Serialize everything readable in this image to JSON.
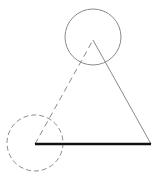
{
  "diagram": {
    "type": "geometric-figure",
    "canvas": {
      "width": 159,
      "height": 181,
      "background": "#ffffff"
    },
    "colors": {
      "thin_stroke": "#8a8a8a",
      "thick_stroke": "#111111"
    },
    "vertices": {
      "apex": {
        "x": 93,
        "y": 40
      },
      "bottom_left": {
        "x": 35,
        "y": 144
      },
      "bottom_right": {
        "x": 151,
        "y": 144
      }
    },
    "circles": [
      {
        "name": "top-circle",
        "cx": 93,
        "cy": 37,
        "r": 28,
        "style": "solid"
      },
      {
        "name": "bottom-left-circle",
        "cx": 35,
        "cy": 143,
        "r": 28,
        "style": "dashed"
      }
    ],
    "segments": [
      {
        "name": "left-side",
        "from": "bottom_left",
        "to": "apex",
        "style": "dashed"
      },
      {
        "name": "right-side",
        "from": "apex",
        "to": "bottom_right",
        "style": "solid"
      },
      {
        "name": "base",
        "from": "bottom_left",
        "to": "bottom_right",
        "style": "thick"
      }
    ]
  }
}
